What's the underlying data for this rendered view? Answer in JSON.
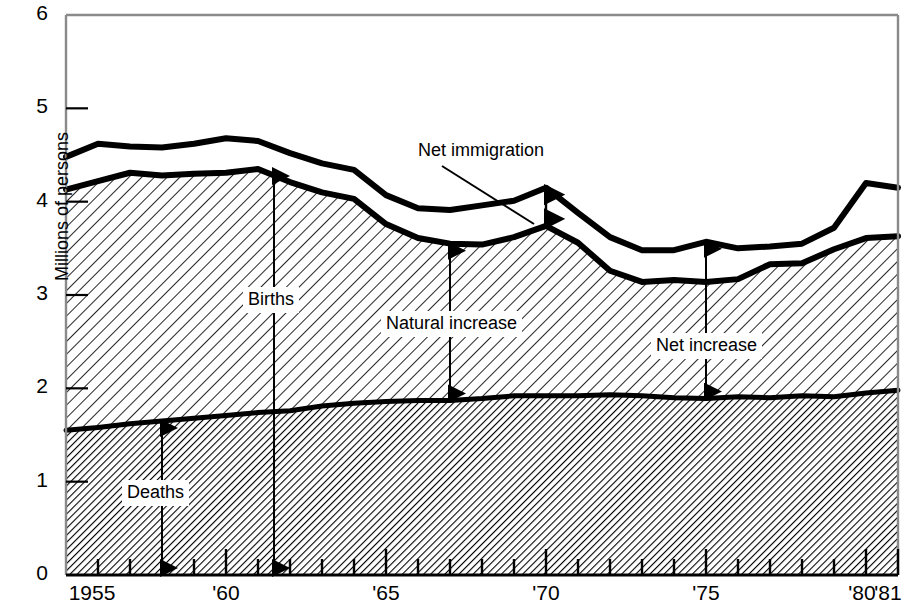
{
  "chart_data": {
    "type": "area",
    "title": "",
    "xlabel": "",
    "ylabel": "Millions of persons",
    "xlim": [
      1955,
      1981
    ],
    "ylim": [
      0,
      6
    ],
    "yticks": [
      0,
      1,
      2,
      3,
      4,
      5,
      6
    ],
    "ytick_labels": [
      "0",
      "1",
      "2",
      "3",
      "4",
      "5",
      "6"
    ],
    "xticks": [
      1955,
      1956,
      1957,
      1958,
      1959,
      1960,
      1961,
      1962,
      1963,
      1964,
      1965,
      1966,
      1967,
      1968,
      1969,
      1970,
      1971,
      1972,
      1973,
      1974,
      1975,
      1976,
      1977,
      1978,
      1979,
      1980,
      1981
    ],
    "xtick_labels": [
      "1955",
      "'60",
      "'65",
      "'70",
      "'75",
      "'80",
      "'81"
    ],
    "xtick_label_years": [
      1955,
      1960,
      1965,
      1970,
      1975,
      1980,
      1981
    ],
    "grid": false,
    "legend": "none",
    "x": [
      1955,
      1956,
      1957,
      1958,
      1959,
      1960,
      1961,
      1962,
      1963,
      1964,
      1965,
      1966,
      1967,
      1968,
      1969,
      1970,
      1971,
      1972,
      1973,
      1974,
      1975,
      1976,
      1977,
      1978,
      1979,
      1980,
      1981
    ],
    "series": [
      {
        "name": "Deaths",
        "units": "millions of persons",
        "values": [
          1.55,
          1.58,
          1.62,
          1.65,
          1.68,
          1.71,
          1.74,
          1.76,
          1.81,
          1.84,
          1.86,
          1.87,
          1.87,
          1.89,
          1.92,
          1.92,
          1.92,
          1.93,
          1.92,
          1.9,
          1.89,
          1.91,
          1.9,
          1.92,
          1.91,
          1.95,
          1.98
        ]
      },
      {
        "name": "Births",
        "units": "millions of persons",
        "values": [
          4.13,
          4.22,
          4.31,
          4.28,
          4.3,
          4.31,
          4.35,
          4.21,
          4.1,
          4.03,
          3.76,
          3.61,
          3.55,
          3.54,
          3.62,
          3.74,
          3.56,
          3.26,
          3.14,
          3.16,
          3.14,
          3.17,
          3.33,
          3.34,
          3.49,
          3.61,
          3.63
        ]
      },
      {
        "name": "Net increase",
        "units": "millions of persons",
        "values": [
          4.48,
          4.62,
          4.59,
          4.58,
          4.62,
          4.68,
          4.65,
          4.52,
          4.41,
          4.34,
          4.07,
          3.93,
          3.91,
          3.96,
          4.01,
          4.15,
          3.88,
          3.62,
          3.48,
          3.48,
          3.57,
          3.5,
          3.52,
          3.55,
          3.72,
          4.2,
          4.15
        ]
      }
    ],
    "derived_series": [
      {
        "name": "Natural increase",
        "definition": "Births minus deaths",
        "units": "millions of persons"
      },
      {
        "name": "Net immigration",
        "definition": "Net increase minus births",
        "units": "millions of persons"
      }
    ],
    "annotations": [
      {
        "id": "deaths",
        "label": "Deaths",
        "arrow": "double",
        "year": 1958,
        "from_value": 1.65,
        "to_value": 0.0
      },
      {
        "id": "births",
        "label": "Births",
        "arrow": "double",
        "year": 1961.5,
        "from_value": 4.35,
        "to_value": 0.0
      },
      {
        "id": "natural-increase",
        "label": "Natural increase",
        "arrow": "double",
        "year": 1967,
        "from_value": 3.55,
        "to_value": 1.87
      },
      {
        "id": "net-increase",
        "label": "Net increase",
        "arrow": "double",
        "year": 1975,
        "from_value": 3.57,
        "to_value": 1.89
      },
      {
        "id": "net-immigration",
        "label": "Net immigration",
        "arrow": "double",
        "year": 1970,
        "from_value": 4.15,
        "to_value": 3.74,
        "leader_line": true
      }
    ]
  },
  "axes": {
    "y_axis_title": "Millions of persons",
    "y_tick_labels": [
      "6",
      "5",
      "4",
      "3",
      "2",
      "1",
      "0"
    ],
    "x_tick_labels": [
      "1955",
      "'60",
      "'65",
      "'70",
      "'75",
      "'80",
      "'81"
    ]
  },
  "labels": {
    "deaths": "Deaths",
    "births": "Births",
    "natural_increase": "Natural increase",
    "net_increase": "Net increase",
    "net_immigration": "Net immigration"
  },
  "colors": {
    "line": "#000000",
    "background": "#ffffff",
    "hatch": "#000000",
    "axis": "#7f7f7f"
  }
}
